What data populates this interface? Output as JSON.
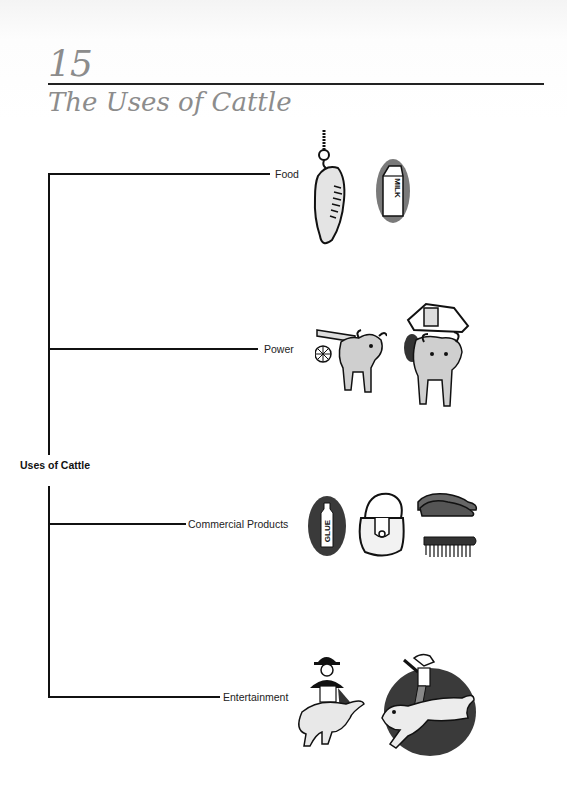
{
  "page": {
    "chapter_number": "15",
    "chapter_title": "The Uses of Cattle"
  },
  "diagram": {
    "root": "Uses of Cattle",
    "branches": [
      {
        "label": "Food",
        "illustrations": [
          "hanging-meat-cut",
          "milk-carton"
        ],
        "carton_text": "MILK"
      },
      {
        "label": "Power",
        "illustrations": [
          "ox-pulling-cart",
          "ox-carrying-load"
        ]
      },
      {
        "label": "Commercial Products",
        "illustrations": [
          "glue-bottle",
          "leather-handbag",
          "leather-shoes",
          "bristle-brush"
        ],
        "bottle_text": "GLUE"
      },
      {
        "label": "Entertainment",
        "illustrations": [
          "bullfighter-with-bull",
          "rodeo-bull-rider"
        ]
      }
    ]
  }
}
